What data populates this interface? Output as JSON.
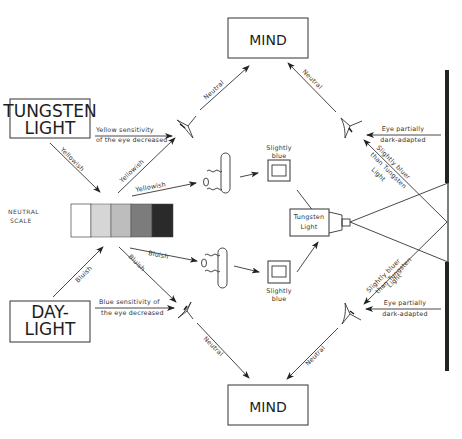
{
  "boxes": {
    "mind_top": "MIND",
    "mind_bottom": "MIND",
    "tungsten_line1": "TUNGSTEN",
    "tungsten_line2": "LIGHT",
    "daylight_line1": "DAY-",
    "daylight_line2": "LIGHT",
    "projector_line1": "Tungsten",
    "projector_line2": "Light"
  },
  "scale": {
    "label_line1": "NEUTRAL",
    "label_line2": "SCALE",
    "swatches": [
      "#ffffff",
      "#d6d6d6",
      "#bdbdbd",
      "#7c7c7c",
      "#2a2a2a"
    ]
  },
  "labels": {
    "yellowish_1": "Yellowish",
    "yellowish_2": "Yellowish",
    "yellowish_3": "Yellowish",
    "bluish_1": "Bluish",
    "bluish_2": "Bluish",
    "bluish_3": "Bluish",
    "yellow_sens_1": "Yellow sensitivity",
    "yellow_sens_2": "of the eye decreased",
    "blue_sens_1": "Blue sensitivity of",
    "blue_sens_2": "the eye decreased",
    "neutral_tl": "Neutral",
    "neutral_tr": "Neutral",
    "neutral_bl": "Neutral",
    "neutral_br": "Neutral",
    "slightly_blue_top_1": "Slightly",
    "slightly_blue_top_2": "blue",
    "slightly_blue_bot_1": "Slightly",
    "slightly_blue_bot_2": "blue",
    "eye_dark_top_1": "Eye partially",
    "eye_dark_top_2": "dark-adapted",
    "eye_dark_bot_1": "Eye partially",
    "eye_dark_bot_2": "dark-adapted",
    "bluer_top_1": "Slightly bluer",
    "bluer_top_2": "than Tungsten",
    "bluer_top_3": "Light",
    "bluer_bot_1": "Slightly bluer",
    "bluer_bot_2": "than Tungsten",
    "bluer_bot_3": "Light"
  }
}
